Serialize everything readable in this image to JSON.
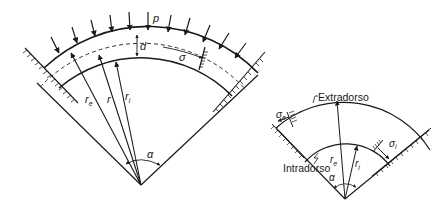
{
  "left_diagram": {
    "labels": {
      "load": "p",
      "thickness": "d",
      "stress": "σ",
      "outer_radius": "r",
      "outer_radius_sub": "e",
      "mean_radius": "r",
      "inner_radius": "r",
      "inner_radius_sub": "i",
      "angle": "α"
    }
  },
  "right_diagram": {
    "labels": {
      "extrados": "Extradorso",
      "intrados": "Intradorso",
      "outer_stress": "σ",
      "outer_stress_sub": "e",
      "inner_stress": "σ",
      "inner_stress_sub": "i",
      "outer_radius": "r",
      "outer_radius_sub": "e",
      "inner_radius": "r",
      "inner_radius_sub": "i",
      "angle": "α"
    }
  },
  "colors": {
    "line": "#1a1a1a",
    "background": "#ffffff"
  }
}
